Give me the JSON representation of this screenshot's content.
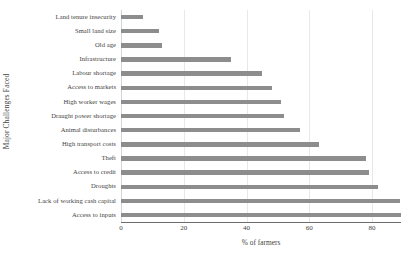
{
  "chart_data": {
    "type": "bar",
    "orientation": "horizontal",
    "title": "",
    "xlabel": "% of farmers",
    "ylabel": "Major Challenges Faced",
    "categories": [
      "Land tenure insecurity",
      "Small land size",
      "Old age",
      "Infrastructure",
      "Labour shortage",
      "Access to markets",
      "High worker wages",
      "Draught power shortage",
      "Animal disturbances",
      "High transport costs",
      "Theft",
      "Access to credit",
      "Droughts",
      "Lack of working cash capital",
      "Access to inputs"
    ],
    "values": [
      7,
      12,
      13,
      35,
      45,
      48,
      51,
      52,
      57,
      63,
      78,
      79,
      82,
      89,
      93
    ],
    "xlim": [
      0,
      93
    ],
    "xticks": [
      0,
      20,
      40,
      60,
      80
    ],
    "xtick_labels": [
      "0",
      "20",
      "40",
      "60",
      "80"
    ],
    "grid": true,
    "legend": "none",
    "bar_color": "#8d8d8d",
    "axis_color": "#6b6b6b",
    "gridline_color": "#e8e8e8"
  }
}
